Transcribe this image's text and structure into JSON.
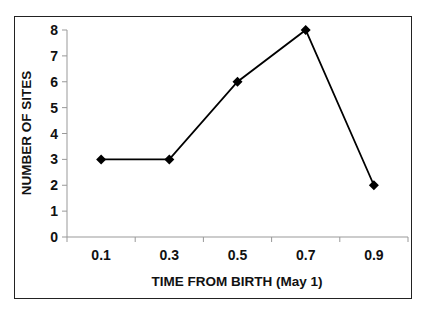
{
  "chart_data": {
    "type": "line",
    "title": "",
    "xlabel": "TIME FROM BIRTH (May 1)",
    "ylabel": "NUMBER OF SITES",
    "categories": [
      "0.1",
      "0.3",
      "0.5",
      "0.7",
      "0.9"
    ],
    "series": [
      {
        "name": "Number of sites",
        "values": [
          3,
          3,
          6,
          8,
          2
        ],
        "marker": "diamond",
        "color": "#000000"
      }
    ],
    "ylim": [
      0,
      8
    ],
    "yticks": [
      "0",
      "1",
      "2",
      "3",
      "4",
      "5",
      "6",
      "7",
      "8"
    ],
    "grid": false,
    "legend": null
  }
}
